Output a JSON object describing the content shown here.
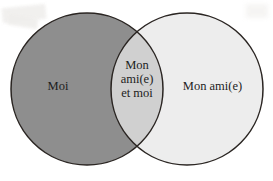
{
  "diagram": {
    "type": "venn-two-set",
    "title": "",
    "background_color": "#ffffff",
    "stroke_color": "#2a2522",
    "stroke_width": 1.5,
    "text_color": "#1d1d1d",
    "sets": {
      "left": {
        "label": "Moi",
        "fill_color": "#8e8e8e",
        "center_x": 87,
        "center_y": 89,
        "radius": 76
      },
      "right": {
        "label": "Mon ami(e)",
        "fill_color": "#ededed",
        "center_x": 187,
        "center_y": 89,
        "radius": 76
      },
      "intersection": {
        "label_lines": [
          "Mon",
          "ami(e)",
          "et moi"
        ],
        "fill_color": "#d0d0d0"
      }
    }
  }
}
